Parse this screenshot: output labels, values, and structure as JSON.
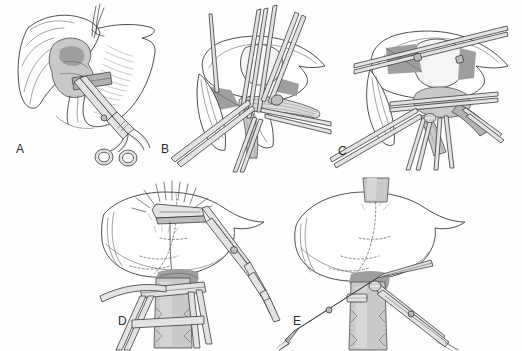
{
  "figure": {
    "kind": "surgical-illustration-plate",
    "panel_count": 5,
    "background_color": "#fefefe",
    "line_color": "#3a3a3a",
    "shade_color": "#c9c9c9",
    "label_color": "#2a2a2a"
  },
  "panels": [
    {
      "id": "A",
      "label": "A",
      "label_x": 16,
      "label_y": 150,
      "x": 0,
      "y": 0,
      "width": 172,
      "height": 172,
      "caption": "Liver with hilar structures exposed; curved hemostat clamp applied to pedicle",
      "elements": [
        {
          "name": "liver-outline",
          "type": "organ"
        },
        {
          "name": "gallbladder",
          "type": "organ"
        },
        {
          "name": "portal-pedicle",
          "type": "vessel"
        },
        {
          "name": "hemostat-clamp",
          "type": "instrument"
        },
        {
          "name": "suture-ligature",
          "type": "suture"
        }
      ]
    },
    {
      "id": "B",
      "label": "B",
      "label_x": 161,
      "label_y": 150,
      "x": 165,
      "y": 0,
      "width": 168,
      "height": 172,
      "caption": "Posterior view of liver with multiple vascular clamps and retracting tapes",
      "elements": [
        {
          "name": "liver-outline",
          "type": "organ"
        },
        {
          "name": "vena-cava",
          "type": "vessel"
        },
        {
          "name": "vascular-clamp-set",
          "type": "instrument"
        },
        {
          "name": "retraction-tape",
          "type": "instrument"
        }
      ]
    },
    {
      "id": "C",
      "label": "C",
      "label_x": 338,
      "label_y": 152,
      "x": 330,
      "y": 0,
      "width": 192,
      "height": 172,
      "caption": "Liver mobilized with cross-clamps in place and divided pedicle branches",
      "elements": [
        {
          "name": "liver-outline",
          "type": "organ"
        },
        {
          "name": "hepatic-vein",
          "type": "vessel"
        },
        {
          "name": "cross-clamp",
          "type": "instrument"
        },
        {
          "name": "pedicle-branch",
          "type": "vessel"
        }
      ]
    },
    {
      "id": "D",
      "label": "D",
      "label_x": 118,
      "label_y": 322,
      "x": 100,
      "y": 178,
      "width": 190,
      "height": 173,
      "caption": "Parenchymal transection along demarcation line; stapler fired at hepatic vein with spray",
      "elements": [
        {
          "name": "liver-outline",
          "type": "organ"
        },
        {
          "name": "demarcation-line",
          "type": "dashed-line"
        },
        {
          "name": "surgical-stapler",
          "type": "instrument"
        },
        {
          "name": "spray-burst",
          "type": "annotation"
        },
        {
          "name": "vena-cava",
          "type": "vessel"
        },
        {
          "name": "clamped-pedicle",
          "type": "vessel"
        }
      ]
    },
    {
      "id": "E",
      "label": "E",
      "label_x": 293,
      "label_y": 322,
      "x": 285,
      "y": 178,
      "width": 237,
      "height": 173,
      "caption": "Completed resection with pedicle ligated and clamps on inflow and outflow vessels",
      "elements": [
        {
          "name": "liver-outline",
          "type": "organ"
        },
        {
          "name": "demarcation-line",
          "type": "dashed-line"
        },
        {
          "name": "vena-cava",
          "type": "vessel"
        },
        {
          "name": "inflow-clamp",
          "type": "instrument"
        },
        {
          "name": "outflow-clamp",
          "type": "instrument"
        },
        {
          "name": "ligature-tie",
          "type": "suture"
        }
      ]
    }
  ]
}
